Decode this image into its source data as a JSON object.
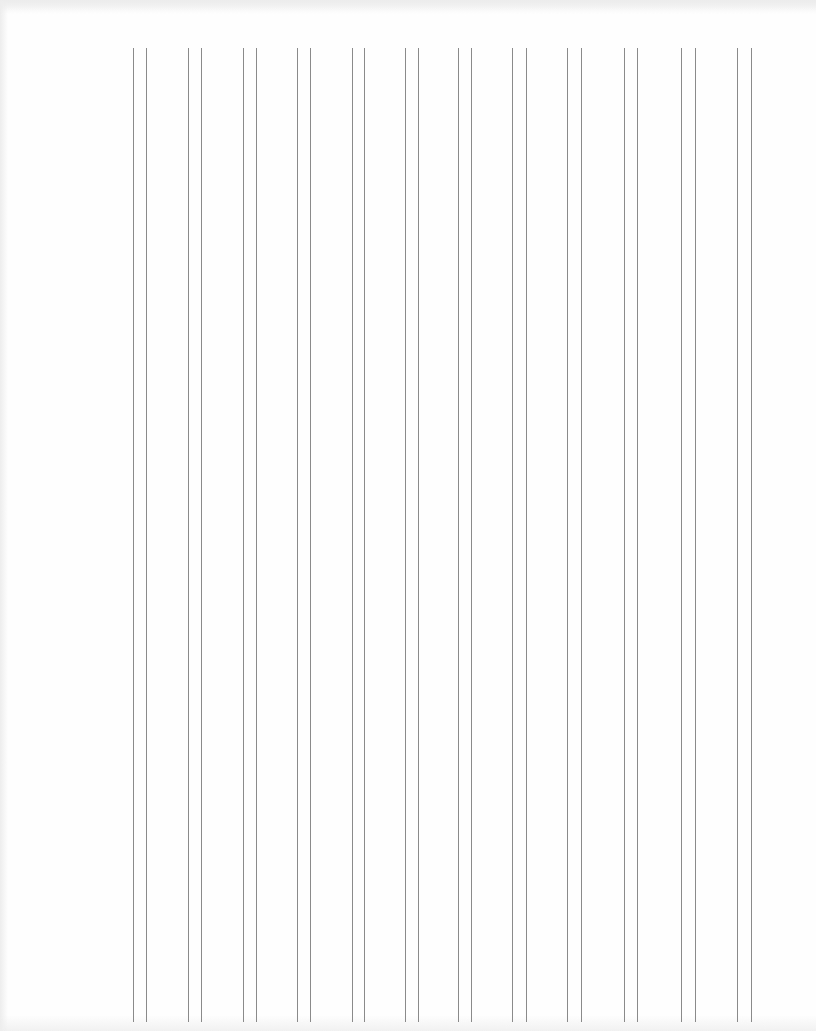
{
  "document": {
    "type": "ruled-column-sheet",
    "orientation": "vertical-lines",
    "column_count": 12,
    "line_style": "double-rule",
    "line_color": "#8a8a8a",
    "background_color": "#fdfdfd",
    "text_content": []
  }
}
